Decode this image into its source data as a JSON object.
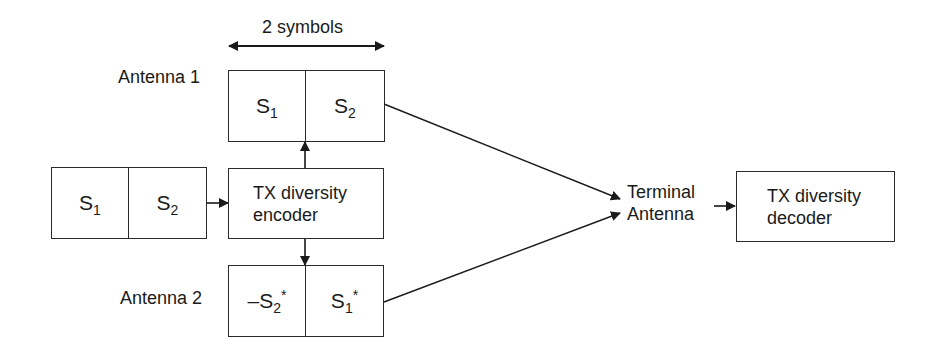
{
  "diagram": {
    "title_width_label": "2 symbols",
    "antenna1": {
      "label": "Antenna 1",
      "cells": [
        {
          "base": "S",
          "sub": "1",
          "sup": "",
          "prefix": ""
        },
        {
          "base": "S",
          "sub": "2",
          "sup": "",
          "prefix": ""
        }
      ]
    },
    "antenna2": {
      "label": "Antenna 2",
      "cells": [
        {
          "base": "S",
          "sub": "2",
          "sup": "*",
          "prefix": "–"
        },
        {
          "base": "S",
          "sub": "1",
          "sup": "*",
          "prefix": ""
        }
      ]
    },
    "input": {
      "cells": [
        {
          "base": "S",
          "sub": "1",
          "sup": "",
          "prefix": ""
        },
        {
          "base": "S",
          "sub": "2",
          "sup": "",
          "prefix": ""
        }
      ]
    },
    "encoder": {
      "line1": "TX diversity",
      "line2": "encoder"
    },
    "terminal": {
      "line1": "Terminal",
      "line2": "Antenna"
    },
    "decoder": {
      "line1": "TX diversity",
      "line2": "decoder"
    },
    "colors": {
      "stroke": "#2a2a2a",
      "text": "#1a1a1a",
      "background": "#ffffff"
    }
  }
}
